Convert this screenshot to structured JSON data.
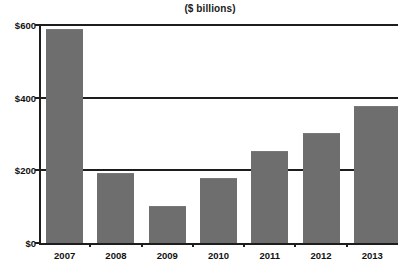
{
  "chart_data": {
    "type": "bar",
    "title": "($ billions)",
    "xlabel": "",
    "ylabel": "",
    "categories": [
      "2007",
      "2008",
      "2009",
      "2010",
      "2011",
      "2012",
      "2013"
    ],
    "values": [
      585,
      190,
      100,
      175,
      250,
      300,
      375
    ],
    "ylim": [
      0,
      600
    ],
    "ytick_values": [
      0,
      200,
      400,
      600
    ],
    "ytick_labels": [
      "$0",
      "$200",
      "$400",
      "$600"
    ],
    "grid": "horizontal",
    "legend": "none",
    "series": [
      {
        "name": "($ billions)",
        "values": [
          585,
          190,
          100,
          175,
          250,
          300,
          375
        ]
      }
    ],
    "colors": {
      "bar_fill": "#6e6e6e",
      "axis": "#1d1d1d",
      "gridline": "#1d1d1d",
      "background": "#ffffff",
      "text": "#111111"
    }
  }
}
